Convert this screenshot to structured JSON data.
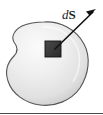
{
  "figure": {
    "kind": "physics-surface-element-diagram",
    "clipped_caption_fragment": "",
    "labels": {
      "area_element": {
        "differential": "d",
        "vector": "S",
        "full": "dS"
      }
    },
    "colors": {
      "background": "#ffffff",
      "surface_fill_light": "#f2f2f2",
      "surface_fill_mid": "#e3e3e3",
      "surface_fill_shadow": "#c9c9c9",
      "surface_outline": "#565656",
      "patch_fill": "#3a3a3a",
      "patch_outline": "#111111",
      "arrow_color": "#111111",
      "baseline_rule": "#4a4a4a",
      "label_color": "#1a1a1a"
    },
    "geometry": {
      "canvas_width": 103,
      "canvas_height": 115,
      "blob_top_y": 22,
      "blob_bottom_y": 106,
      "blob_left_x": 4,
      "blob_right_x": 88,
      "patch": {
        "x": 45,
        "y": 41,
        "width": 16,
        "height": 16
      },
      "arrow_start": {
        "x": 55,
        "y": 49
      },
      "arrow_end": {
        "x": 96,
        "y": 9
      }
    },
    "elements": {
      "surface_name": "closed-surface-blob",
      "patch_name": "area-element-patch",
      "arrow_name": "outward-normal-arrow",
      "rule_name": "bottom-rule"
    }
  }
}
